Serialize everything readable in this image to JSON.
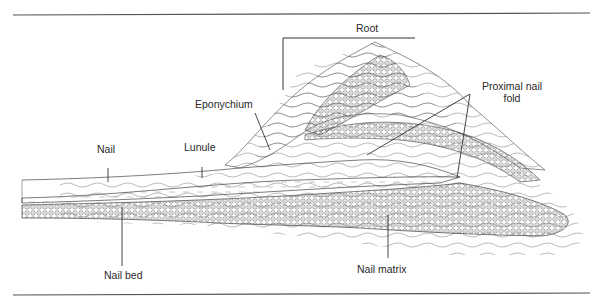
{
  "diagram": {
    "labels": {
      "root": "Root",
      "eponychium": "Eponychium",
      "proximal_nail_fold_line1": "Proximal nail",
      "proximal_nail_fold_line2": "fold",
      "nail": "Nail",
      "lunule": "Lunule",
      "nail_bed": "Nail bed",
      "nail_matrix": "Nail matrix"
    },
    "colors": {
      "ink": "#2a2a2a",
      "rule": "#555555",
      "background": "#ffffff"
    }
  }
}
